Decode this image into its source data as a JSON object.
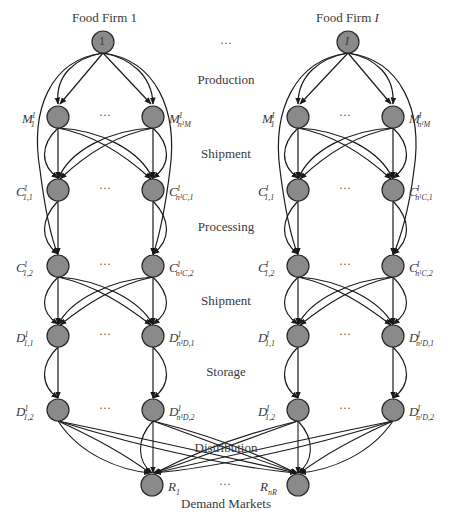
{
  "diagram": {
    "firms": [
      {
        "title": "Food Firm 1",
        "top_node_label": "1",
        "superscript": "1"
      },
      {
        "title": "Food Firm I",
        "top_node_label": "I",
        "superscript": "I"
      }
    ],
    "between_firms_ellipsis": "···",
    "stages": [
      "Production",
      "Shipment",
      "Processing",
      "Shipment",
      "Storage",
      "Distribution"
    ],
    "demand_markets": {
      "title": "Demand Markets",
      "nodes": [
        "R1",
        "RnR"
      ],
      "ellipsis": "···"
    },
    "node_labels": {
      "firm1": {
        "M_left": {
          "base": "M",
          "sup": "1",
          "sub": "1"
        },
        "M_right": {
          "base": "M",
          "sup": "1",
          "sub": "n¹M"
        },
        "C1_left": {
          "base": "C",
          "sup": "1",
          "sub": "1,1"
        },
        "C1_right": {
          "base": "C",
          "sup": "1",
          "sub": "n¹C,1"
        },
        "C2_left": {
          "base": "C",
          "sup": "1",
          "sub": "1,2"
        },
        "C2_right": {
          "base": "C",
          "sup": "1",
          "sub": "n¹C,2"
        },
        "D1_left": {
          "base": "D",
          "sup": "1",
          "sub": "1,1"
        },
        "D1_right": {
          "base": "D",
          "sup": "1",
          "sub": "n¹D,1"
        },
        "D2_left": {
          "base": "D",
          "sup": "1",
          "sub": "1,2"
        },
        "D2_right": {
          "base": "D",
          "sup": "1",
          "sub": "n¹D,2"
        }
      },
      "firmI": {
        "M_left": {
          "base": "M",
          "sup": "I",
          "sub": "1"
        },
        "M_right": {
          "base": "M",
          "sup": "I",
          "sub": "nᴵM"
        },
        "C1_left": {
          "base": "C",
          "sup": "I",
          "sub": "1,1"
        },
        "C1_right": {
          "base": "C",
          "sup": "I",
          "sub": "nᴵC,1"
        },
        "C2_left": {
          "base": "C",
          "sup": "I",
          "sub": "1,2"
        },
        "C2_right": {
          "base": "C",
          "sup": "I",
          "sub": "nᴵC,2"
        },
        "D1_left": {
          "base": "D",
          "sup": "I",
          "sub": "1,1"
        },
        "D1_right": {
          "base": "D",
          "sup": "I",
          "sub": "nᴵD,1"
        },
        "D2_left": {
          "base": "D",
          "sup": "I",
          "sub": "1,2"
        },
        "D2_right": {
          "base": "D",
          "sup": "I",
          "sub": "nᴵD,2"
        }
      },
      "R1": {
        "base": "R",
        "sub": "1"
      },
      "RnR": {
        "base": "R",
        "sub": "nR"
      }
    },
    "colors": {
      "node_fill": "#8a8a8a",
      "node_stroke": "#2a2a2a",
      "edge": "#1a1a1a",
      "text": "#3a3a3a"
    }
  }
}
